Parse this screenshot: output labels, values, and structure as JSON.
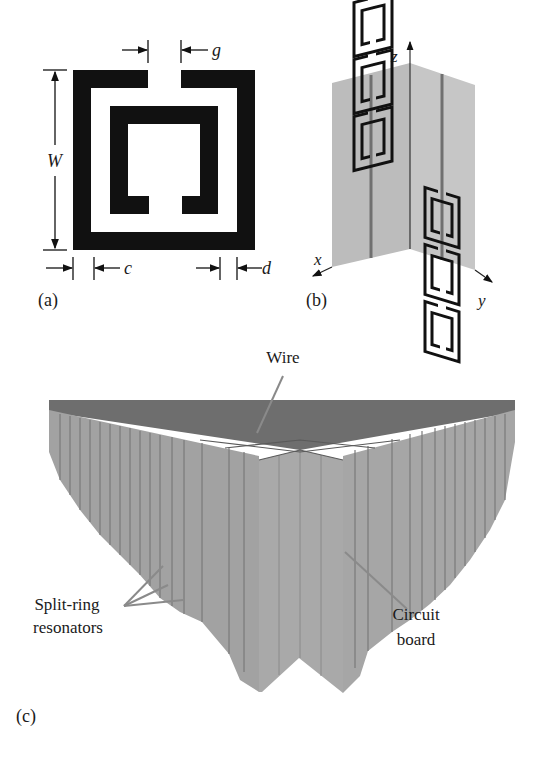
{
  "figure": {
    "panels": [
      {
        "id": "a",
        "label": "(a)",
        "description": "Square split-ring resonator with dimension annotations",
        "dimension_labels": {
          "gap": "g",
          "width": "W",
          "line_width": "c",
          "ring_spacing": "d"
        }
      },
      {
        "id": "b",
        "label": "(b)",
        "description": "Two orthogonal circuit boards with split-ring resonators and wires",
        "axes": {
          "x": "x",
          "y": "y",
          "z": "z"
        },
        "rings_per_face": 3
      },
      {
        "id": "c",
        "label": "(c)",
        "description": "3D array of intersecting circuit boards forming a metamaterial",
        "callouts": {
          "wire": "Wire",
          "srr_line1": "Split-ring",
          "srr_line2": "resonators",
          "board_line1": "Circuit",
          "board_line2": "board"
        }
      }
    ],
    "colors": {
      "ink": "#111111",
      "board_fill": "#a9a9a9",
      "board_light": "#bdbdbd",
      "board_top": "#6e6e6e",
      "board_line": "#7a7a7a",
      "leader": "#8a8a8a"
    }
  }
}
